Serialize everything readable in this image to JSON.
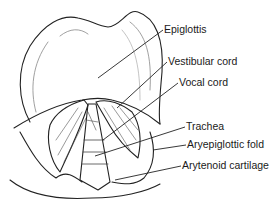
{
  "figure": {
    "labels": [
      {
        "id": "epiglottis",
        "text": "Epiglottis",
        "x": 164,
        "y": 23,
        "target": [
          98,
          78
        ]
      },
      {
        "id": "vestibular-cord",
        "text": "Vestibular cord",
        "x": 168,
        "y": 55,
        "target": [
          117,
          108
        ]
      },
      {
        "id": "vocal-cord",
        "text": "Vocal cord",
        "x": 179,
        "y": 76,
        "target": [
          103,
          140
        ]
      },
      {
        "id": "trachea",
        "text": "Trachea",
        "x": 186,
        "y": 120,
        "target": [
          95,
          156
        ]
      },
      {
        "id": "aryepiglottic-fold",
        "text": "Aryepiglottic fold",
        "x": 187,
        "y": 138,
        "target": [
          153,
          150
        ]
      },
      {
        "id": "arytenoid-cartilage",
        "text": "Arytenoid cartilage",
        "x": 182,
        "y": 159,
        "target": [
          115,
          180
        ]
      }
    ]
  }
}
